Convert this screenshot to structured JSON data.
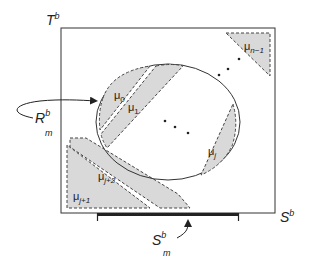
{
  "diagram": {
    "axes": {
      "vertical_label": "T",
      "vertical_sup": "b",
      "horizontal_label": "S",
      "horizontal_sup": "b"
    },
    "region_label": {
      "main": "R",
      "sup": "b",
      "sub": "m"
    },
    "bracket_label": {
      "main": "S",
      "sup": "b",
      "sub": "m"
    },
    "regions": [
      {
        "id": "mu0",
        "label": "μ",
        "sub": "0"
      },
      {
        "id": "mu1",
        "label": "μ",
        "sub": "1"
      },
      {
        "id": "muj",
        "label": "μ",
        "sub": "j"
      },
      {
        "id": "muj1",
        "label": "μ",
        "sub": "j+1"
      },
      {
        "id": "muj2",
        "label": "μ",
        "sub": "j+2"
      },
      {
        "id": "mun1",
        "label": "μ",
        "sub": "n−1"
      }
    ],
    "colors": {
      "region_fill": "#d9d9d9",
      "stroke": "#333333"
    }
  }
}
